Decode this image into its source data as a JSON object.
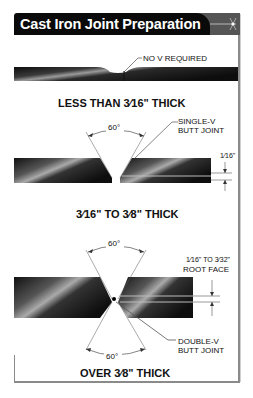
{
  "title": "Cast Iron Joint Preparation",
  "sections": [
    {
      "id": "thin",
      "annotation": "NO V REQUIRED",
      "heading": "LESS THAN 3⁄16\"  THICK"
    },
    {
      "id": "medium",
      "angle": "60°",
      "joint_label_line1": "SINGLE-V",
      "joint_label_line2": "BUTT JOINT",
      "gap_label": "1⁄16\"",
      "heading": "3⁄16\" TO 3⁄8\" THICK"
    },
    {
      "id": "thick",
      "angle_top": "60°",
      "angle_bottom": "60°",
      "root_face_line1": "1⁄16\" TO 3⁄32\"",
      "root_face_line2": "ROOT FACE",
      "joint_label_line1": "DOUBLE-V",
      "joint_label_line2": "BUTT JOINT",
      "heading": "OVER 3⁄8\" THICK"
    }
  ],
  "colors": {
    "title_bg": "#0a0a0a",
    "title_text": "#ffffff",
    "metal_dark": "#111111",
    "metal_highlight": "#9a9a9a",
    "frame": "#8a8a8a"
  }
}
